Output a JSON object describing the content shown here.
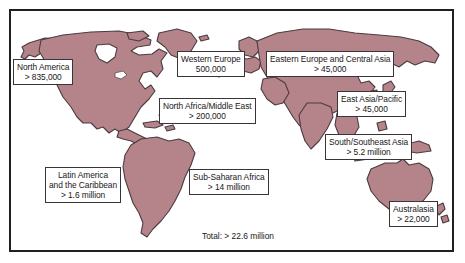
{
  "figure": {
    "kind": "world-map-infographic",
    "land_fill": "#b5848a",
    "land_stroke": "#4a3b3e",
    "frame_color": "#231f20",
    "label_bg": "#ffffff",
    "label_border": "#3a3436",
    "text_color": "#1a1718"
  },
  "regions": [
    {
      "name": "north-america",
      "title": "North America",
      "value": "> 835,000",
      "lines": [
        "North America",
        "> 835,000"
      ]
    },
    {
      "name": "western-europe",
      "title": "Western Europe",
      "value": "500,000",
      "lines": [
        "Western Europe",
        "500,000"
      ]
    },
    {
      "name": "eastern-europe-and-central-asia",
      "title": "Eastern Europe and Central Asia",
      "value": "> 45,000",
      "lines": [
        "Eastern Europe and Central Asia",
        "> 45,000"
      ]
    },
    {
      "name": "north-africa-middle-east",
      "title": "North Africa/Middle East",
      "value": "> 200,000",
      "lines": [
        "North Africa/Middle East",
        "> 200,000"
      ]
    },
    {
      "name": "east-asia-pacific",
      "title": "East Asia/Pacific",
      "value": "> 45,000",
      "lines": [
        "East Asia/Pacific",
        "> 45,000"
      ]
    },
    {
      "name": "south-southeast-asia",
      "title": "South/Southeast Asia",
      "value": "> 5.2 million",
      "lines": [
        "South/Southeast Asia",
        "> 5.2 million"
      ]
    },
    {
      "name": "latin-america-and-the-caribbean",
      "title": "Latin America and the Caribbean",
      "value": "> 1.6 million",
      "lines": [
        "Latin America",
        "and the Caribbean",
        "> 1.6 million"
      ]
    },
    {
      "name": "sub-saharan-africa",
      "title": "Sub-Saharan Africa",
      "value": "> 14 million",
      "lines": [
        "Sub-Saharan Africa",
        "> 14 million"
      ]
    },
    {
      "name": "australasia",
      "title": "Australasia",
      "value": "> 22,000",
      "lines": [
        "Australasia",
        "> 22,000"
      ]
    }
  ],
  "total": {
    "label": "Total: > 22.6 million"
  }
}
